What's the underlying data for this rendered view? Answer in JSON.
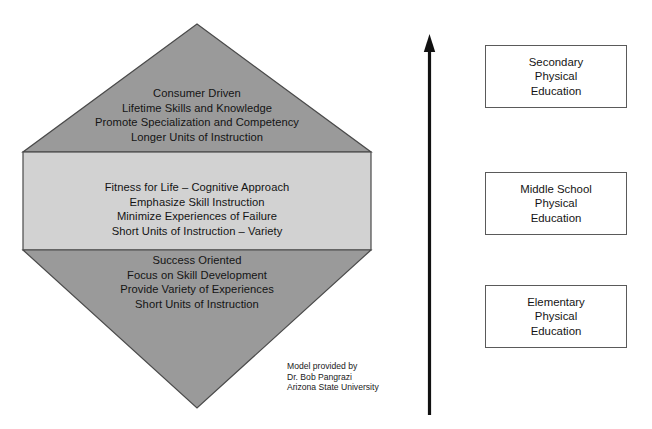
{
  "diagram": {
    "colors": {
      "upper_triangle_fill": "#9a9a9a",
      "lower_triangle_fill": "#9a9a9a",
      "middle_band_fill": "#d2d2d2",
      "outline": "#4a4a4a",
      "arrow": "#111111",
      "box_border": "#5a5a5a",
      "box_fill": "#ffffff",
      "text": "#141414",
      "background": "#ffffff"
    },
    "tiers": [
      {
        "id": "upper-tier",
        "shape": "upward-triangle",
        "lines": [
          "Consumer Driven",
          "Lifetime Skills and Knowledge",
          "Promote Specialization and Competency",
          "Longer Units of Instruction"
        ]
      },
      {
        "id": "middle-tier",
        "shape": "rectangle-band",
        "lines": [
          "Fitness for Life – Cognitive Approach",
          "Emphasize Skill Instruction",
          "Minimize Experiences of Failure",
          "Short Units of Instruction – Variety"
        ]
      },
      {
        "id": "lower-tier",
        "shape": "downward-triangle",
        "lines": [
          "Success Oriented",
          "Focus on Skill Development",
          "Provide Variety of Experiences",
          "Short Units of Instruction"
        ]
      }
    ],
    "attribution": [
      "Model provided by",
      "Dr. Bob Pangrazi",
      "Arizona State University"
    ],
    "arrow": {
      "icon": "upward-arrow-icon",
      "direction": "up"
    },
    "levels": [
      {
        "id": "secondary",
        "lines": [
          "Secondary",
          "Physical",
          "Education"
        ]
      },
      {
        "id": "middle-school",
        "lines": [
          "Middle School",
          "Physical",
          "Education"
        ]
      },
      {
        "id": "elementary",
        "lines": [
          "Elementary",
          "Physical",
          "Education"
        ]
      }
    ]
  }
}
